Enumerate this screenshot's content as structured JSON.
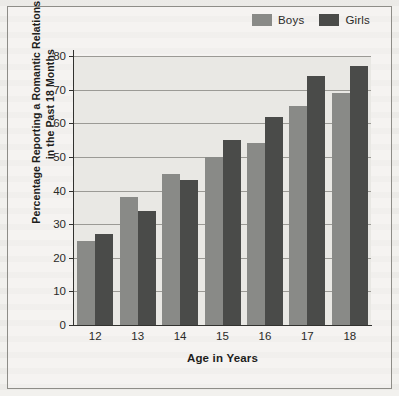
{
  "chart_data": {
    "type": "bar",
    "title": "",
    "xlabel": "Age in Years",
    "ylabel": "Percentage Reporting a Romantic Relationship in the Past 18 Months",
    "categories": [
      "12",
      "13",
      "14",
      "15",
      "16",
      "17",
      "18"
    ],
    "series": [
      {
        "name": "Boys",
        "color": "#898a87",
        "values": [
          25,
          38,
          45,
          50,
          54,
          65,
          69
        ]
      },
      {
        "name": "Girls",
        "color": "#4a4b49",
        "values": [
          27,
          34,
          43,
          55,
          62,
          74,
          77
        ]
      }
    ],
    "ylim": [
      0,
      80
    ],
    "ytick_labels": [
      "80",
      "70",
      "60",
      "50",
      "40",
      "30",
      "20",
      "10",
      "0"
    ],
    "ytick_values": [
      80,
      70,
      60,
      50,
      40,
      30,
      20,
      10,
      0
    ],
    "grid": true,
    "legend_position": "top-right"
  },
  "legend": {
    "entries": [
      {
        "label": "Boys",
        "swatch": "#898a87"
      },
      {
        "label": "Girls",
        "swatch": "#4a4b49"
      }
    ]
  },
  "axes": {
    "y_title": "Percentage Reporting a Romantic Relationship in the Past 18 Months",
    "x_title": "Age in Years"
  }
}
